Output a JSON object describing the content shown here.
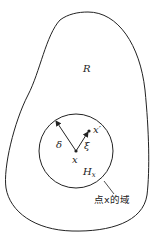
{
  "diagram": {
    "region_label": "R",
    "neighborhood_label_main": "H",
    "neighborhood_label_sub": "x",
    "radius_label": "δ",
    "displacement_label": "ξ",
    "point_label": "x",
    "neighbor_point_label": "x′",
    "domain_caption": "点x的域",
    "colors": {
      "stroke": "#222222",
      "background": "#ffffff"
    }
  }
}
